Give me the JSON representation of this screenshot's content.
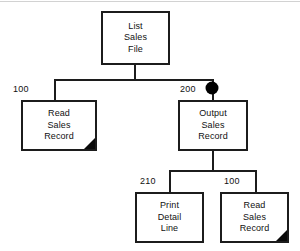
{
  "diagram": {
    "type": "structure-chart",
    "line_color": "#1c1c1c",
    "fill_color": "#ffffff",
    "text_color": "#111111",
    "nodes": [
      {
        "id": "list-sales-file",
        "name": "list-sales-file",
        "lines": [
          "List",
          "Sales",
          "File"
        ],
        "x": 101,
        "y": 11,
        "w": 69,
        "h": 54,
        "label": "",
        "predefined": false
      },
      {
        "id": "read-sales-record-left",
        "name": "read-sales-record",
        "lines": [
          "Read",
          "Sales",
          "Record"
        ],
        "x": 21,
        "y": 100,
        "w": 76,
        "h": 51,
        "label": "100",
        "predefined": true
      },
      {
        "id": "output-sales-record",
        "name": "output-sales-record",
        "lines": [
          "Output",
          "Sales",
          "Record"
        ],
        "x": 178,
        "y": 100,
        "w": 70,
        "h": 51,
        "label": "200",
        "predefined": false
      },
      {
        "id": "print-detail-line",
        "name": "print-detail-line",
        "lines": [
          "Print",
          "Detail",
          "Line"
        ],
        "x": 135,
        "y": 192,
        "w": 69,
        "h": 51,
        "label": "210",
        "predefined": false
      },
      {
        "id": "read-sales-record-bottom",
        "name": "read-sales-record",
        "lines": [
          "Read",
          "Sales",
          "Record"
        ],
        "x": 220,
        "y": 192,
        "w": 69,
        "h": 51,
        "label": "100",
        "predefined": true
      }
    ],
    "labels": {
      "left_child_number": "100",
      "right_child_number": "200",
      "lower_left_number": "210",
      "lower_right_number": "100"
    },
    "iteration_marker": {
      "name": "loop-marker",
      "cx": 212,
      "cy": 88,
      "r": 6.5,
      "color": "#000000"
    },
    "connectors": {
      "root_stem": {
        "x": 135,
        "y1": 65,
        "y2": 80
      },
      "level1_bar": {
        "x1": 55,
        "x2": 213,
        "y": 80
      },
      "level1_left_drop": {
        "x": 55,
        "y1": 80,
        "y2": 100
      },
      "level1_right_drop": {
        "x": 213,
        "y1": 80,
        "y2": 100
      },
      "level2_stem": {
        "x": 213,
        "y1": 151,
        "y2": 171
      },
      "level2_bar": {
        "x1": 170,
        "x2": 256,
        "y": 171
      },
      "level2_left_drop": {
        "x": 170,
        "y1": 171,
        "y2": 192
      },
      "level2_right_drop": {
        "x": 256,
        "y1": 171,
        "y2": 192
      }
    }
  }
}
